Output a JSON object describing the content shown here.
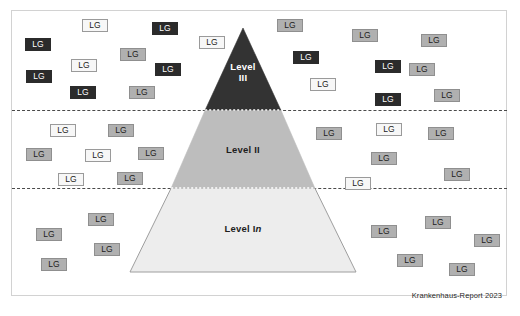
{
  "figure": {
    "source_note": "Krankenhaus-Report 2023",
    "frame": {
      "border_color": "#d2d2d2"
    },
    "divider_color": "#4a4a4a"
  },
  "pyramid": {
    "apex": {
      "x": 243,
      "y": 28
    },
    "base_left": {
      "x": 130,
      "y": 272
    },
    "base_right": {
      "x": 356,
      "y": 272
    },
    "tiers": [
      {
        "id": "level-3",
        "label": "Level\nIII",
        "label_plain": "Level III",
        "fill": "#333333",
        "text_color": "#ffffff",
        "top_y": 28,
        "bottom_y": 110
      },
      {
        "id": "level-2",
        "label": "Level II",
        "label_plain": "Level II",
        "fill": "#bdbdbd",
        "text_color": "#1e1e1e",
        "top_y": 110,
        "bottom_y": 188
      },
      {
        "id": "level-1",
        "label_prefix": "Level I",
        "label_suffix": "n",
        "label_plain": "Level In",
        "fill": "#ededed",
        "text_color": "#1e1e1e",
        "top_y": 188,
        "bottom_y": 272
      }
    ]
  },
  "chips": {
    "label": "LG",
    "styles": {
      "dark": {
        "bg": "#2b2b2b",
        "fg": "#ffffff"
      },
      "mid": {
        "bg": "#b0b0b0",
        "fg": "#1c1c1c"
      },
      "light": {
        "bg": "#f7f7f7",
        "fg": "#1c1c1c"
      }
    },
    "band_top": [
      {
        "x": 82,
        "y": 19,
        "tone": "light"
      },
      {
        "x": 152,
        "y": 22,
        "tone": "dark"
      },
      {
        "x": 277,
        "y": 19,
        "tone": "mid"
      },
      {
        "x": 352,
        "y": 29,
        "tone": "mid"
      },
      {
        "x": 421,
        "y": 34,
        "tone": "mid"
      },
      {
        "x": 25,
        "y": 38,
        "tone": "dark"
      },
      {
        "x": 120,
        "y": 48,
        "tone": "mid"
      },
      {
        "x": 199,
        "y": 36,
        "tone": "light"
      },
      {
        "x": 293,
        "y": 51,
        "tone": "dark"
      },
      {
        "x": 310,
        "y": 78,
        "tone": "light"
      },
      {
        "x": 71,
        "y": 59,
        "tone": "light"
      },
      {
        "x": 26,
        "y": 70,
        "tone": "dark"
      },
      {
        "x": 70,
        "y": 86,
        "tone": "dark"
      },
      {
        "x": 129,
        "y": 86,
        "tone": "mid"
      },
      {
        "x": 375,
        "y": 60,
        "tone": "dark"
      },
      {
        "x": 409,
        "y": 63,
        "tone": "mid"
      },
      {
        "x": 375,
        "y": 93,
        "tone": "dark"
      },
      {
        "x": 434,
        "y": 89,
        "tone": "mid"
      },
      {
        "x": 155,
        "y": 63,
        "tone": "dark"
      }
    ],
    "band_middle": [
      {
        "x": 50,
        "y": 124,
        "tone": "light"
      },
      {
        "x": 108,
        "y": 124,
        "tone": "mid"
      },
      {
        "x": 26,
        "y": 148,
        "tone": "mid"
      },
      {
        "x": 85,
        "y": 149,
        "tone": "light"
      },
      {
        "x": 138,
        "y": 147,
        "tone": "mid"
      },
      {
        "x": 58,
        "y": 173,
        "tone": "light"
      },
      {
        "x": 117,
        "y": 172,
        "tone": "mid"
      },
      {
        "x": 316,
        "y": 127,
        "tone": "mid"
      },
      {
        "x": 376,
        "y": 123,
        "tone": "light"
      },
      {
        "x": 428,
        "y": 127,
        "tone": "mid"
      },
      {
        "x": 371,
        "y": 152,
        "tone": "mid"
      },
      {
        "x": 444,
        "y": 168,
        "tone": "mid"
      },
      {
        "x": 345,
        "y": 177,
        "tone": "light"
      }
    ],
    "band_bottom": [
      {
        "x": 88,
        "y": 213,
        "tone": "mid"
      },
      {
        "x": 36,
        "y": 228,
        "tone": "mid"
      },
      {
        "x": 94,
        "y": 243,
        "tone": "mid"
      },
      {
        "x": 41,
        "y": 258,
        "tone": "mid"
      },
      {
        "x": 371,
        "y": 225,
        "tone": "mid"
      },
      {
        "x": 425,
        "y": 216,
        "tone": "mid"
      },
      {
        "x": 474,
        "y": 234,
        "tone": "mid"
      },
      {
        "x": 397,
        "y": 254,
        "tone": "mid"
      },
      {
        "x": 449,
        "y": 263,
        "tone": "mid"
      }
    ]
  }
}
